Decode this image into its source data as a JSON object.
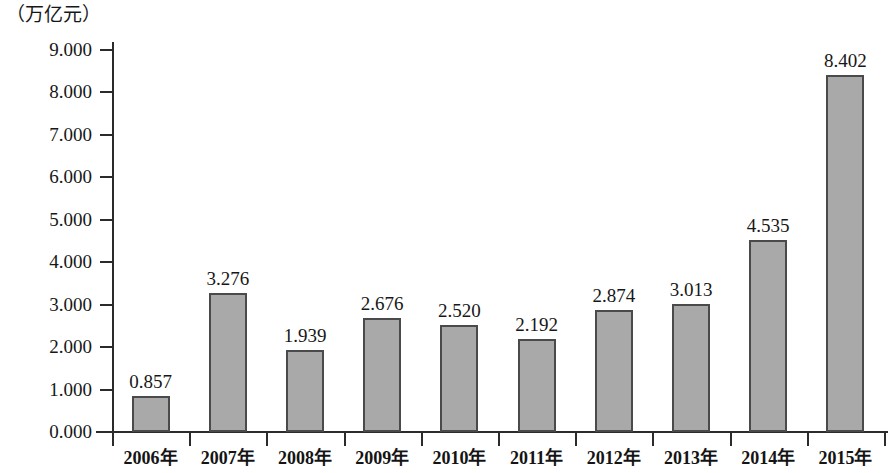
{
  "chart_data": {
    "type": "bar",
    "title": "",
    "subtitle": "",
    "xlabel": "",
    "ylabel": "（万亿元）",
    "unit_label": "（万亿元）",
    "categories": [
      "2006年",
      "2007年",
      "2008年",
      "2009年",
      "2010年",
      "2011年",
      "2012年",
      "2013年",
      "2014年",
      "2015年"
    ],
    "values": [
      0.857,
      3.276,
      1.939,
      2.676,
      2.52,
      2.192,
      2.874,
      3.013,
      4.535,
      8.402
    ],
    "value_labels": [
      "0.857",
      "3.276",
      "1.939",
      "2.676",
      "2.520",
      "2.192",
      "2.874",
      "3.013",
      "4.535",
      "8.402"
    ],
    "ylim": [
      0,
      9
    ],
    "ytick_values": [
      9,
      8,
      7,
      6,
      5,
      4,
      3,
      2,
      1,
      0
    ],
    "ytick_labels": [
      "9.000",
      "8.000",
      "7.000",
      "6.000",
      "5.000",
      "4.000",
      "3.000",
      "2.000",
      "1.000",
      "0.000"
    ],
    "grid": false,
    "legend": null,
    "legend_position": "none",
    "bar_fill_color": "#a9a9a9",
    "bar_border_color": "#4a4a4a",
    "axis_color": "#2b2b2b",
    "background_color": "#ffffff",
    "data_labels_shown": true
  }
}
